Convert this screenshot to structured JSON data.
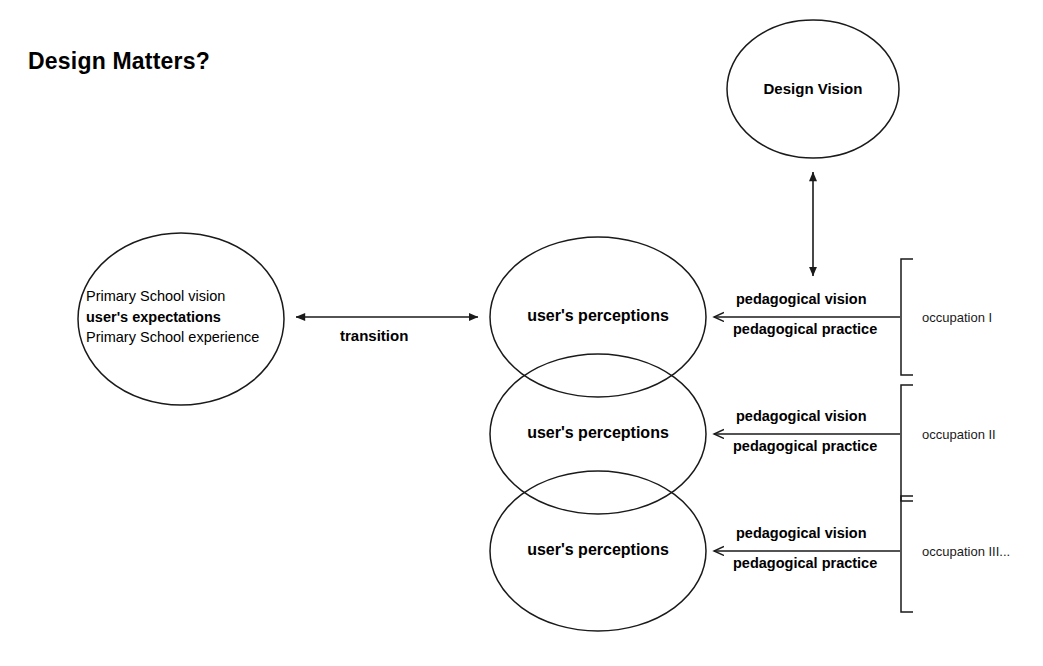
{
  "title": "Design Matters?",
  "nodes": {
    "design_vision": {
      "label": "Design Vision"
    },
    "left_ellipse": {
      "lines": [
        {
          "text": "Primary School vision",
          "bold": false
        },
        {
          "text": "user's expectations",
          "bold": true
        },
        {
          "text": "Primary School experience",
          "bold": false
        }
      ]
    },
    "perceptions": [
      {
        "label": "user's perceptions"
      },
      {
        "label": "user's perceptions"
      },
      {
        "label": "user's perceptions"
      }
    ]
  },
  "edges": {
    "transition": {
      "label": "transition",
      "style": "double-headed-horizontal-arrow"
    },
    "design_vision_link": {
      "label": "",
      "style": "double-headed-vertical-arrow"
    },
    "occupations": [
      {
        "vision_label": "pedagogical vision",
        "practice_label": "pedagogical practice",
        "bracket_label": "occupation I"
      },
      {
        "vision_label": "pedagogical vision",
        "practice_label": "pedagogical practice",
        "bracket_label": "occupation II"
      },
      {
        "vision_label": "pedagogical vision",
        "practice_label": "pedagogical practice",
        "bracket_label": "occupation III..."
      }
    ]
  },
  "colors": {
    "stroke": "#1a1a1a",
    "text": "#000000",
    "background": "#ffffff"
  }
}
